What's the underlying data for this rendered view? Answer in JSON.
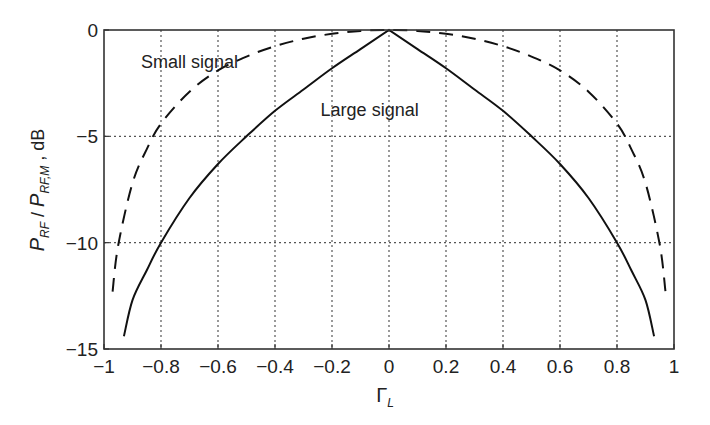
{
  "chart_data": {
    "type": "line",
    "title": "",
    "xlabel": "Γ_L",
    "xlabel_main": "Γ",
    "xlabel_sub": "L",
    "ylabel": "P_RF / P_RF,M , dB",
    "xlim": [
      -1,
      1
    ],
    "ylim": [
      -15,
      0
    ],
    "grid": true,
    "xticks": [
      -1,
      -0.8,
      -0.6,
      -0.4,
      -0.2,
      0,
      0.2,
      0.4,
      0.6,
      0.8,
      1
    ],
    "xtick_labels": [
      "−1",
      "−0.8",
      "−0.6",
      "−0.4",
      "−0.2",
      "0",
      "0.2",
      "0.4",
      "0.6",
      "0.8",
      "1"
    ],
    "yticks": [
      0,
      -5,
      -10,
      -15
    ],
    "ytick_labels": [
      "0",
      "−5",
      "−10",
      "−15"
    ],
    "series": [
      {
        "name": "Small signal",
        "style": "dashed",
        "x": [
          -0.97,
          -0.95,
          -0.9,
          -0.85,
          -0.8,
          -0.7,
          -0.6,
          -0.5,
          -0.4,
          -0.3,
          -0.2,
          -0.1,
          0,
          0.1,
          0.2,
          0.3,
          0.4,
          0.5,
          0.6,
          0.7,
          0.8,
          0.85,
          0.9,
          0.95,
          0.97
        ],
        "y": [
          -12.3,
          -10.1,
          -7.2,
          -5.6,
          -4.4,
          -2.9,
          -1.9,
          -1.25,
          -0.76,
          -0.41,
          -0.18,
          -0.04,
          0,
          -0.04,
          -0.18,
          -0.41,
          -0.76,
          -1.25,
          -1.9,
          -2.9,
          -4.4,
          -5.6,
          -7.2,
          -10.1,
          -12.3
        ]
      },
      {
        "name": "Large signal",
        "style": "solid",
        "x": [
          -0.93,
          -0.9,
          -0.85,
          -0.8,
          -0.7,
          -0.6,
          -0.5,
          -0.4,
          -0.3,
          -0.2,
          -0.1,
          0,
          0.1,
          0.2,
          0.3,
          0.4,
          0.5,
          0.6,
          0.7,
          0.8,
          0.85,
          0.9,
          0.93
        ],
        "y": [
          -14.4,
          -12.7,
          -11.3,
          -10.0,
          -7.9,
          -6.3,
          -5.0,
          -3.8,
          -2.8,
          -1.8,
          -0.9,
          0,
          -0.9,
          -1.8,
          -2.8,
          -3.8,
          -5.0,
          -6.3,
          -7.9,
          -10.0,
          -11.3,
          -12.7,
          -14.4
        ]
      }
    ],
    "annotations": [
      {
        "text": "Small signal",
        "x": -0.87,
        "y": -1.5
      },
      {
        "text": "Large signal",
        "x": -0.24,
        "y": -3.75
      }
    ]
  }
}
